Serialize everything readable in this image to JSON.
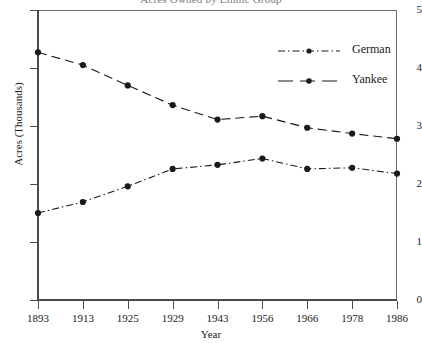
{
  "chart_data": {
    "type": "line",
    "title": "Acres Owned by Ethnic Group",
    "xlabel": "Year",
    "ylabel": "Acres (Thousands)",
    "grid": false,
    "legend_position": "top-right",
    "categories": [
      "1893",
      "1913",
      "1925",
      "1929",
      "1943",
      "1956",
      "1966",
      "1978",
      "1986"
    ],
    "x": [
      1893,
      1913,
      1925,
      1929,
      1943,
      1956,
      1966,
      1978,
      1986
    ],
    "xlim": [
      1893,
      1986
    ],
    "ylim": [
      0,
      5
    ],
    "yticks": [
      "0",
      "1",
      "2",
      "3",
      "4",
      "5"
    ],
    "ytick_values": [
      0,
      1,
      2,
      3,
      4,
      5
    ],
    "series": [
      {
        "name": "German",
        "style": "dash-dot",
        "marker": "filled-circle",
        "color": "#1a1a1a",
        "values": [
          1.5,
          1.69,
          1.96,
          2.26,
          2.33,
          2.44,
          2.26,
          2.28,
          2.18
        ]
      },
      {
        "name": "Yankee",
        "style": "dashed",
        "marker": "filled-circle",
        "color": "#1a1a1a",
        "values": [
          4.27,
          4.05,
          3.7,
          3.36,
          3.11,
          3.17,
          2.97,
          2.87,
          2.78
        ]
      }
    ]
  },
  "legend": {
    "items": [
      {
        "label": "German"
      },
      {
        "label": "Yankee"
      }
    ]
  }
}
